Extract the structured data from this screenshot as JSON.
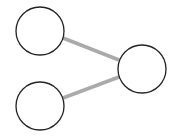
{
  "diagram": {
    "type": "graph",
    "colors": {
      "background": "#ffffff",
      "node_stroke": "#222222",
      "node_fill": "#ffffff",
      "edge": "#aaaaaa"
    },
    "nodes": [
      {
        "id": "n1",
        "cx": 40,
        "cy": 31,
        "r": 24,
        "label": ""
      },
      {
        "id": "n2",
        "cx": 40,
        "cy": 106,
        "r": 24,
        "label": ""
      },
      {
        "id": "n3",
        "cx": 142,
        "cy": 69,
        "r": 24,
        "label": ""
      }
    ],
    "edges": [
      {
        "from": "n1",
        "to": "n3",
        "x1": 63,
        "y1": 38,
        "x2": 119,
        "y2": 60
      },
      {
        "from": "n2",
        "to": "n3",
        "x1": 63,
        "y1": 98,
        "x2": 119,
        "y2": 77
      }
    ]
  }
}
